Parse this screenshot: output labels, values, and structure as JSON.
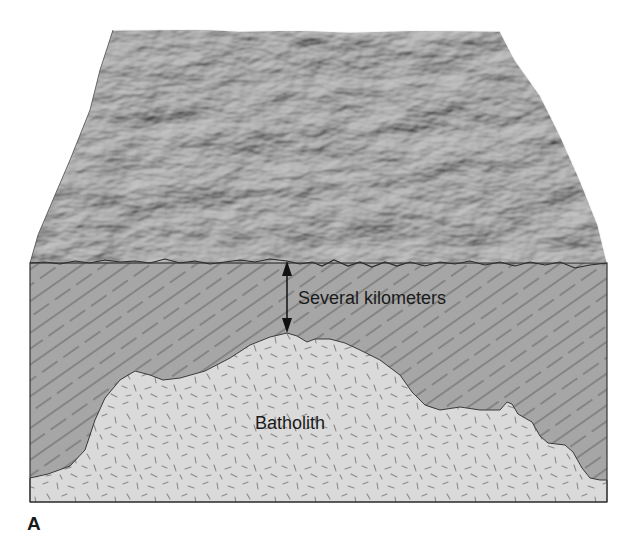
{
  "figure": {
    "panel_label": "A",
    "labels": {
      "thickness": "Several kilometers",
      "intrusion": "Batholith"
    },
    "regions": [
      {
        "name": "land-surface",
        "description": "Eroded mountainous terrain surface",
        "color": "#7a7a7a"
      },
      {
        "name": "country-rock",
        "description": "Foliated overlying rock with diagonal line pattern",
        "color": "#a6a6a6"
      },
      {
        "name": "batholith",
        "description": "Intrusive igneous body with speckled dash texture",
        "color": "#d9d9d9"
      }
    ],
    "annotations": [
      {
        "type": "double-arrow",
        "meaning": "depth from surface to batholith top",
        "label": "Several kilometers"
      }
    ],
    "colors": {
      "outline": "#333333",
      "hatch": "#5a5a5a",
      "speckle": "#8a8a8a",
      "text": "#1a1a1a"
    }
  }
}
